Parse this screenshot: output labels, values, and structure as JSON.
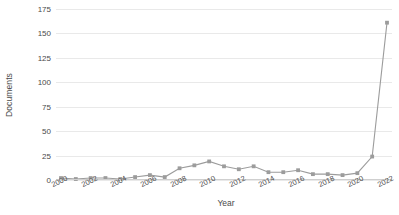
{
  "chart_data": {
    "type": "line",
    "title": "",
    "xlabel": "Year",
    "ylabel": "Documents",
    "xlim": [
      2000,
      2022
    ],
    "ylim": [
      0,
      175
    ],
    "yticks": [
      0,
      25,
      50,
      75,
      100,
      125,
      150,
      175
    ],
    "xticks": [
      2000,
      2002,
      2004,
      2006,
      2008,
      2010,
      2012,
      2014,
      2016,
      2018,
      2020,
      2022
    ],
    "grid": true,
    "legend": false,
    "marker": "square",
    "line_color": "#9c9c9c",
    "marker_color": "#9c9c9c",
    "grid_color": "#e9e9e9",
    "x": [
      2000,
      2001,
      2002,
      2003,
      2004,
      2005,
      2006,
      2007,
      2008,
      2009,
      2010,
      2011,
      2012,
      2013,
      2014,
      2015,
      2016,
      2017,
      2018,
      2019,
      2020,
      2021,
      2022
    ],
    "series": [
      {
        "name": "Documents",
        "values": [
          2,
          1,
          2,
          2,
          1,
          3,
          5,
          3,
          12,
          15,
          19,
          14,
          11,
          14,
          8,
          8,
          10,
          6,
          6,
          5,
          7,
          24,
          161
        ]
      }
    ],
    "categories": [
      "2000",
      "2001",
      "2002",
      "2003",
      "2004",
      "2005",
      "2006",
      "2007",
      "2008",
      "2009",
      "2010",
      "2011",
      "2012",
      "2013",
      "2014",
      "2015",
      "2016",
      "2017",
      "2018",
      "2019",
      "2020",
      "2021",
      "2022"
    ]
  },
  "axis": {
    "y_title": "Documents",
    "x_title": "Year",
    "y_tick_labels": [
      "0",
      "25",
      "50",
      "75",
      "100",
      "125",
      "150",
      "175"
    ],
    "x_tick_labels": [
      "2000",
      "2002",
      "2004",
      "2006",
      "2008",
      "2010",
      "2012",
      "2014",
      "2016",
      "2018",
      "2020",
      "2022"
    ]
  }
}
